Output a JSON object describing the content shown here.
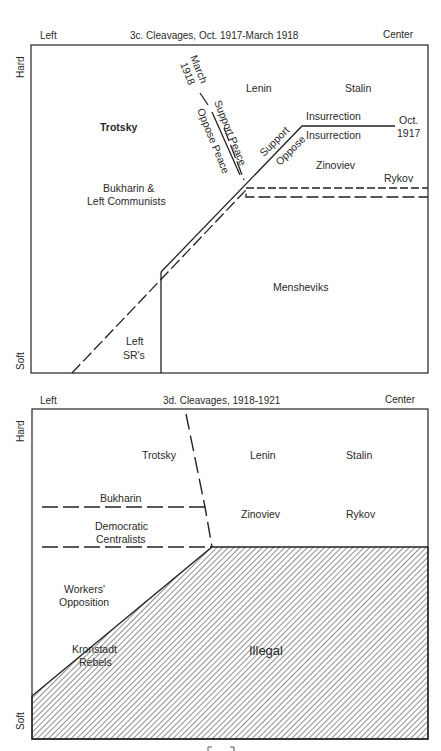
{
  "diagram_3c": {
    "title": "3c. Cleavages, Oct. 1917-March 1918",
    "axis_left": "Left",
    "axis_right": "Center",
    "axis_top": "Hard",
    "axis_bottom": "Soft",
    "labels": {
      "march_1918_a": "March",
      "march_1918_b": "1918",
      "support_peace": "Support Peace",
      "oppose_peace": "Oppose Peace",
      "lenin": "Lenin",
      "stalin": "Stalin",
      "trotsky": "Trotsky",
      "insurrection_top": "Insurrection",
      "insurrection_bottom": "Insurrection",
      "oct_a": "Oct.",
      "oct_b": "1917",
      "support": "Support",
      "oppose": "Oppose",
      "zinoviev": "Zinoviev",
      "rykov": "Rykov",
      "bukharin_a": "Bukharin &",
      "bukharin_b": "Left Communists",
      "mensheviks": "Mensheviks",
      "left_srs_a": "Left",
      "left_srs_b": "SR's"
    }
  },
  "diagram_3d": {
    "title": "3d. Cleavages, 1918-1921",
    "axis_left": "Left",
    "axis_right": "Center",
    "axis_top": "Hard",
    "axis_bottom": "Soft",
    "labels": {
      "trotsky": "Trotsky",
      "lenin": "Lenin",
      "stalin": "Stalin",
      "bukharin": "Bukharin",
      "zinoviev": "Zinoviev",
      "rykov": "Rykov",
      "democratic_a": "Democratic",
      "democratic_b": "Centralists",
      "workers_a": "Workers'",
      "workers_b": "Opposition",
      "kronstadt_a": "Kronstadt",
      "kronstadt_b": "Rebels",
      "illegal": "Illegal"
    }
  }
}
